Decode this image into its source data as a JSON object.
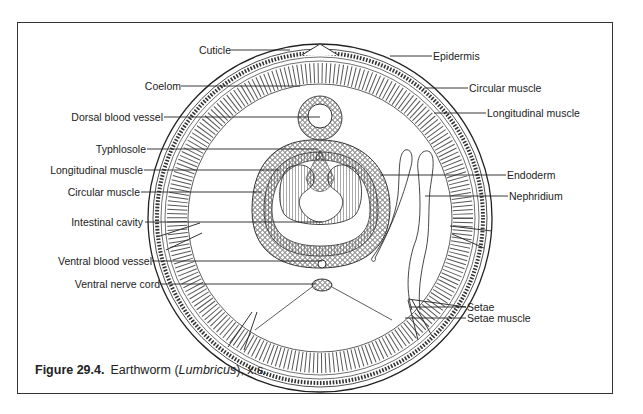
{
  "figure": {
    "caption": {
      "number": "Figure 29.4.",
      "text_before": "Earthworm (",
      "italic": "Lumbricus",
      "text_after": "), x.s."
    },
    "labels_left": [
      {
        "id": "cuticle",
        "text": "Cuticle"
      },
      {
        "id": "coelom",
        "text": "Coelom"
      },
      {
        "id": "dorsal-blood-vessel",
        "text": "Dorsal blood vessel"
      },
      {
        "id": "typhlosole",
        "text": "Typhlosole"
      },
      {
        "id": "longitudinal-muscle-inner",
        "text": "Longitudinal muscle"
      },
      {
        "id": "circular-muscle-inner",
        "text": "Circular muscle"
      },
      {
        "id": "intestinal-cavity",
        "text": "Intestinal cavity"
      },
      {
        "id": "ventral-blood-vessel",
        "text": "Ventral blood vessel"
      },
      {
        "id": "ventral-nerve-cord",
        "text": "Ventral nerve cord"
      }
    ],
    "labels_right": [
      {
        "id": "epidermis",
        "text": "Epidermis"
      },
      {
        "id": "circular-muscle-outer",
        "text": "Circular muscle"
      },
      {
        "id": "longitudinal-muscle-outer",
        "text": "Longitudinal muscle"
      },
      {
        "id": "endoderm",
        "text": "Endoderm"
      },
      {
        "id": "nephridium",
        "text": "Nephridium"
      },
      {
        "id": "setae",
        "text": "Setae"
      },
      {
        "id": "setae-muscle",
        "text": "Setae muscle"
      }
    ]
  }
}
